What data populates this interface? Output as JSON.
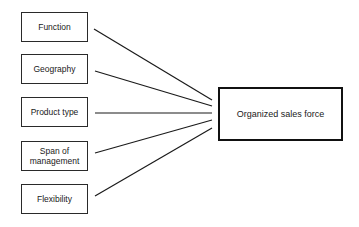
{
  "diagram": {
    "type": "many-to-one influence diagram",
    "factors": [
      {
        "id": "function",
        "label": "Function"
      },
      {
        "id": "geography",
        "label": "Geography"
      },
      {
        "id": "product-type",
        "label": "Product type"
      },
      {
        "id": "span-of-management",
        "label": "Span of\nmanagement"
      },
      {
        "id": "flexibility",
        "label": "Flexibility"
      }
    ],
    "outcome": {
      "id": "organized-sales-force",
      "label": "Organized sales force"
    },
    "edges": [
      {
        "from": "function",
        "to": "organized-sales-force"
      },
      {
        "from": "geography",
        "to": "organized-sales-force"
      },
      {
        "from": "product-type",
        "to": "organized-sales-force"
      },
      {
        "from": "span-of-management",
        "to": "organized-sales-force"
      },
      {
        "from": "flexibility",
        "to": "organized-sales-force"
      }
    ]
  }
}
